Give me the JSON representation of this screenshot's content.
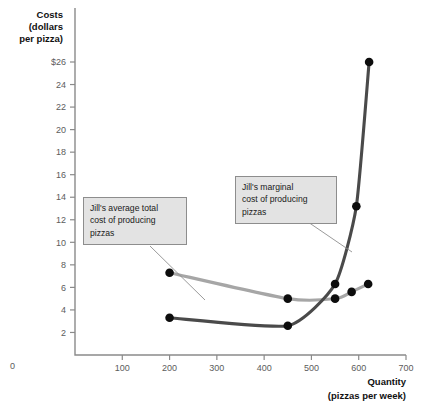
{
  "chart_data": {
    "type": "line",
    "title": "",
    "ylabel": "Costs (dollars per pizza)",
    "xlabel": "Quantity (pizzas per week)",
    "xlim": [
      0,
      700
    ],
    "ylim": [
      0,
      26
    ],
    "grid": false,
    "legend_position": "annotations",
    "xticks": [
      0,
      100,
      200,
      300,
      400,
      500,
      600,
      700
    ],
    "xticklabels": [
      "0",
      "100",
      "200",
      "300",
      "400",
      "500",
      "600",
      "700"
    ],
    "yticks": [
      2,
      4,
      6,
      8,
      10,
      12,
      14,
      16,
      18,
      20,
      22,
      24,
      26
    ],
    "yticklabels": [
      "2",
      "4",
      "6",
      "8",
      "10",
      "12",
      "14",
      "16",
      "18",
      "20",
      "22",
      "24",
      "$26"
    ],
    "series": [
      {
        "name": "Jill's average total cost of producing pizzas",
        "key": "atc",
        "color": "#a6a6a6",
        "x": [
          200,
          450,
          550,
          585,
          620
        ],
        "values": [
          7.3,
          5.0,
          5.0,
          5.6,
          6.3
        ]
      },
      {
        "name": "Jill's marginal cost of producing pizzas",
        "key": "mc",
        "color": "#4a4a4a",
        "x": [
          200,
          450,
          550,
          595,
          622
        ],
        "values": [
          3.3,
          2.6,
          6.3,
          13.2,
          26.0
        ]
      }
    ],
    "annotations": [
      {
        "id": "atc",
        "text": "Jill's average total cost of producing pizzas",
        "lines": [
          "Jill's average total",
          "cost of producing",
          "pizzas"
        ],
        "points_to_x": 280,
        "points_to_y": 5.2
      },
      {
        "id": "mc",
        "text": "Jill's marginal cost of producing pizzas",
        "lines": [
          "Jill's marginal",
          "cost of producing",
          "pizzas"
        ],
        "points_to_x": 578,
        "points_to_y": 10.4
      }
    ]
  },
  "axes": {
    "y_title_lines": [
      "Costs",
      "(dollars",
      "per pizza)"
    ],
    "x_title_lines": [
      "Quantity",
      "(pizzas per week)"
    ],
    "origin_label": "0"
  },
  "colors": {
    "atc_curve": "#a6a6a6",
    "mc_curve": "#4a4a4a",
    "point": "#0d0d0d",
    "axis": "#8a8a8a",
    "callout_fill": "#e3e3e3",
    "callout_border": "#8d8d8d",
    "background": "#ffffff"
  }
}
